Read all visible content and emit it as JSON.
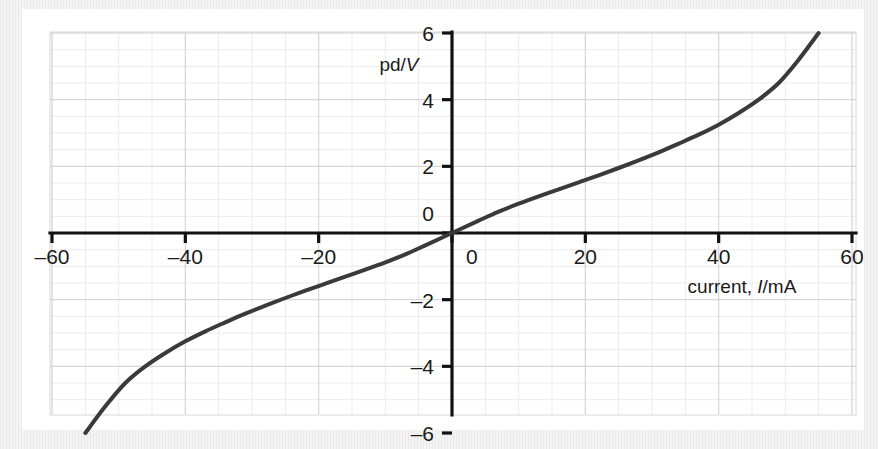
{
  "figure": {
    "background_color": "#eeeeee",
    "plate_color": "#ffffff",
    "curve_color": "#3a3a3a",
    "axis_color": "#111111",
    "grid_minor_color": "#ebebeb",
    "grid_major_color": "#d2d2d2"
  },
  "chart_data": {
    "type": "line",
    "title": "",
    "subtitle": "",
    "xlabel": "current, I/mA",
    "xlabel_plain": "current,",
    "xlabel_symbol": "I",
    "xlabel_unit": "/mA",
    "ylabel": "pd/V",
    "ylabel_plain": "pd/",
    "ylabel_symbol": "V",
    "xlim": [
      -62,
      62
    ],
    "ylim": [
      -6.3,
      6.3
    ],
    "xticks": [
      -60,
      -40,
      -20,
      0,
      20,
      40,
      60
    ],
    "xtick_labels": [
      "–60",
      "–40",
      "–20",
      "0",
      "20",
      "40",
      "60"
    ],
    "yticks": [
      6,
      4,
      2,
      0,
      -2,
      -4,
      -6
    ],
    "ytick_labels": [
      "6",
      "4",
      "2",
      "0",
      "–2",
      "–4",
      "–6"
    ],
    "grid": true,
    "grid_minor_step_x": 5,
    "grid_minor_step_y": 0.5,
    "grid_major_step_x": 20,
    "grid_major_step_y": 2,
    "legend": null,
    "legend_position": "none",
    "series": [
      {
        "name": "filament lamp characteristic",
        "x": [
          -55,
          -52,
          -49,
          -46,
          -43,
          -40,
          -37,
          -34,
          -31,
          -28,
          -25,
          -22,
          -19,
          -16,
          -13,
          -10,
          -7,
          -4,
          0,
          4,
          7,
          10,
          13,
          16,
          19,
          22,
          25,
          28,
          31,
          34,
          37,
          40,
          43,
          46,
          49,
          52,
          55
        ],
        "y": [
          -6.0,
          -5.2,
          -4.5,
          -4.0,
          -3.6,
          -3.25,
          -2.95,
          -2.68,
          -2.42,
          -2.18,
          -1.95,
          -1.73,
          -1.52,
          -1.31,
          -1.1,
          -0.88,
          -0.64,
          -0.37,
          0.0,
          0.37,
          0.64,
          0.88,
          1.1,
          1.31,
          1.52,
          1.73,
          1.95,
          2.18,
          2.42,
          2.68,
          2.95,
          3.25,
          3.6,
          4.0,
          4.5,
          5.2,
          6.0
        ]
      }
    ]
  }
}
